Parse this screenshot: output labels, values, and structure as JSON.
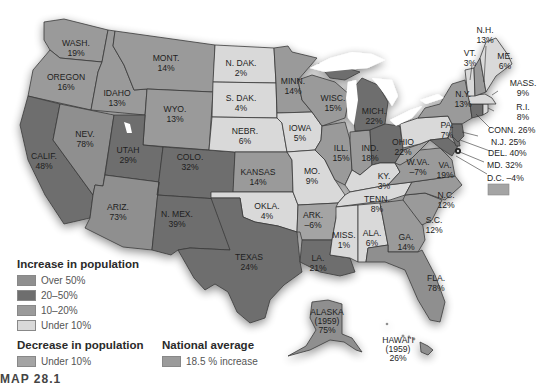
{
  "legend": {
    "increase_title": "Increase in population",
    "increase_items": [
      {
        "label": "Over 50%",
        "color": "#8f8f8f"
      },
      {
        "label": "20–50%",
        "color": "#6e6e6e"
      },
      {
        "label": "10–20%",
        "color": "#9a9a9a"
      },
      {
        "label": "Under 10%",
        "color": "#d9d9d9"
      }
    ],
    "decrease_title": "Decrease in population",
    "decrease_items": [
      {
        "label": "Under 10%",
        "color": "#a4a4a4"
      }
    ],
    "national_title": "National average",
    "national_items": [
      {
        "label": "18.5 % increase",
        "color": "#9b9b9b"
      }
    ]
  },
  "caption": "MAP 28.1",
  "states": {
    "wash": {
      "name": "WASH.",
      "value": "19%"
    },
    "oregon": {
      "name": "OREGON",
      "value": "16%"
    },
    "idaho": {
      "name": "IDAHO",
      "value": "13%"
    },
    "mont": {
      "name": "MONT.",
      "value": "14%"
    },
    "wyo": {
      "name": "WYO.",
      "value": "13%"
    },
    "ndak": {
      "name": "N. DAK.",
      "value": "2%"
    },
    "sdak": {
      "name": "S. DAK.",
      "value": "4%"
    },
    "nebr": {
      "name": "NEBR.",
      "value": "6%"
    },
    "minn": {
      "name": "MINN.",
      "value": "14%"
    },
    "iowa": {
      "name": "IOWA",
      "value": "5%"
    },
    "wisc": {
      "name": "WISC.",
      "value": "15%"
    },
    "mich": {
      "name": "MICH.",
      "value": "22%"
    },
    "calif": {
      "name": "CALIF.",
      "value": "48%"
    },
    "nev": {
      "name": "NEV.",
      "value": "78%"
    },
    "utah": {
      "name": "UTAH",
      "value": "29%"
    },
    "colo": {
      "name": "COLO.",
      "value": "32%"
    },
    "ariz": {
      "name": "ARIZ.",
      "value": "73%"
    },
    "nmex": {
      "name": "N. MEX.",
      "value": "39%"
    },
    "kansas": {
      "name": "KANSAS",
      "value": "14%"
    },
    "mo": {
      "name": "MO.",
      "value": "9%"
    },
    "ill": {
      "name": "ILL.",
      "value": "15%"
    },
    "ind": {
      "name": "IND.",
      "value": "18%"
    },
    "ohio": {
      "name": "OHIO",
      "value": "22%"
    },
    "ky": {
      "name": "KY.",
      "value": "3%"
    },
    "wva": {
      "name": "W.VA.",
      "value": "–7%"
    },
    "va": {
      "name": "VA.",
      "value": "19%"
    },
    "okla": {
      "name": "OKLA.",
      "value": "4%"
    },
    "ark": {
      "name": "ARK.",
      "value": "–6%"
    },
    "tenn": {
      "name": "TENN.",
      "value": "8%"
    },
    "nc": {
      "name": "N.C.",
      "value": "12%"
    },
    "sc": {
      "name": "S.C.",
      "value": "12%"
    },
    "texas": {
      "name": "TEXAS",
      "value": "24%"
    },
    "la": {
      "name": "LA.",
      "value": "21%"
    },
    "miss": {
      "name": "MISS.",
      "value": "1%"
    },
    "ala": {
      "name": "ALA.",
      "value": "6%"
    },
    "ga": {
      "name": "GA.",
      "value": "14%"
    },
    "fla": {
      "name": "FLA.",
      "value": "78%"
    },
    "pa": {
      "name": "PA.",
      "value": "7%"
    },
    "ny": {
      "name": "N.Y.",
      "value": "13%"
    },
    "vt": {
      "name": "VT.",
      "value": "3%"
    },
    "nh": {
      "name": "N.H.",
      "value": "13%"
    },
    "me": {
      "name": "ME.",
      "value": "6%"
    },
    "mass": {
      "name": "MASS.",
      "value": "9%"
    },
    "ri": {
      "name": "R.I.",
      "value": "8%"
    },
    "conn": {
      "name": "CONN.",
      "value": "26%"
    },
    "nj": {
      "name": "N.J.",
      "value": "25%"
    },
    "del": {
      "name": "DEL.",
      "value": "40%"
    },
    "md": {
      "name": "MD.",
      "value": "32%"
    },
    "dc": {
      "name": "D.C.",
      "value": "–4%"
    },
    "alaska": {
      "name": "ALASKA",
      "year": "(1959)",
      "value": "75%"
    },
    "hawaii": {
      "name": "HAWAI'I",
      "year": "(1959)",
      "value": "26%"
    }
  }
}
